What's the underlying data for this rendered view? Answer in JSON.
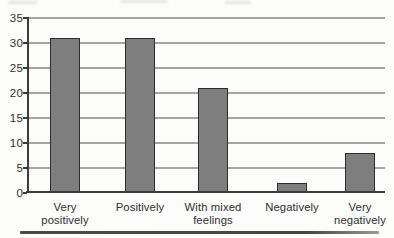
{
  "chart_data": {
    "type": "bar",
    "title": "",
    "xlabel": "",
    "ylabel": "",
    "categories": [
      "Very positively",
      "Positively",
      "With mixed feelings",
      "Negatively",
      "Very negatively"
    ],
    "values": [
      31,
      31,
      21,
      2,
      8
    ],
    "ylim": [
      0,
      35
    ],
    "ytick_step": 5,
    "ytick_labels": [
      "0",
      "5",
      "10",
      "15",
      "20",
      "25",
      "30",
      "35"
    ],
    "grid": true,
    "legend": "none",
    "colors": {
      "bar_fill": "#7e7e7e",
      "bar_border": "#2d2d2d",
      "gridline": "#949494",
      "axis": "#3b3b3b",
      "text": "#2f2f2f",
      "background": "#fcfcfa"
    }
  }
}
